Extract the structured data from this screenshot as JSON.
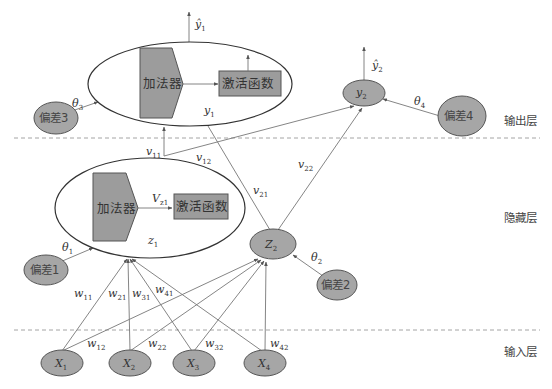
{
  "layers": {
    "output": "输出层",
    "hidden": "隐藏层",
    "input": "输入层"
  },
  "blocks": {
    "adder_output": "加法器",
    "activation_output": "激活函数",
    "adder_hidden": "加法器",
    "activation_hidden": "激活函数"
  },
  "biases": {
    "b1": "偏差1",
    "b2": "偏差2",
    "b3": "偏差3",
    "b4": "偏差4"
  },
  "thetas": {
    "t1": {
      "sym": "θ",
      "sub": "1"
    },
    "t2": {
      "sym": "θ",
      "sub": "2"
    },
    "t3": {
      "sym": "θ",
      "sub": "3"
    },
    "t4": {
      "sym": "θ",
      "sub": "4"
    }
  },
  "inputs": [
    {
      "sym": "X",
      "sub": "1"
    },
    {
      "sym": "X",
      "sub": "2"
    },
    {
      "sym": "X",
      "sub": "3"
    },
    {
      "sym": "X",
      "sub": "4"
    }
  ],
  "hidden_nodes": {
    "z1": {
      "sym": "z",
      "sub": "1"
    },
    "z2": {
      "sym": "Z",
      "sub": "2"
    },
    "vz1": {
      "sym": "V",
      "sub": "z1"
    }
  },
  "output_nodes": {
    "y1": {
      "sym": "y",
      "sub": "1"
    },
    "y2": {
      "sym": "y",
      "sub": "2"
    },
    "yhat1": {
      "sym": "ŷ",
      "sub": "1"
    },
    "yhat2": {
      "sym": "ŷ",
      "sub": "2"
    }
  },
  "weights_input": {
    "w11": {
      "sym": "w",
      "sub": "11"
    },
    "w21": {
      "sym": "w",
      "sub": "21"
    },
    "w31": {
      "sym": "w",
      "sub": "31"
    },
    "w41": {
      "sym": "w",
      "sub": "41"
    },
    "w12": {
      "sym": "w",
      "sub": "12"
    },
    "w22": {
      "sym": "w",
      "sub": "22"
    },
    "w32": {
      "sym": "w",
      "sub": "32"
    },
    "w42": {
      "sym": "w",
      "sub": "42"
    }
  },
  "weights_hidden": {
    "v11": {
      "sym": "v",
      "sub": "11"
    },
    "v12": {
      "sym": "v",
      "sub": "12"
    },
    "v21": {
      "sym": "v",
      "sub": "21"
    },
    "v22": {
      "sym": "v",
      "sub": "22"
    }
  }
}
